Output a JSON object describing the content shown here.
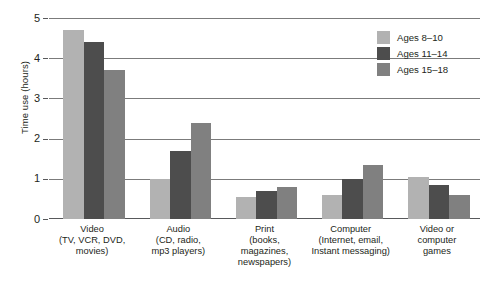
{
  "chart_data": {
    "type": "bar",
    "title": "",
    "xlabel": "",
    "ylabel": "Time use (hours)",
    "ylim": [
      0,
      5
    ],
    "yticks": [
      0,
      1,
      2,
      3,
      4,
      5
    ],
    "ytick_labels": [
      "0",
      "1",
      "2",
      "3",
      "4",
      "5"
    ],
    "grid": true,
    "legend_position": "top-right",
    "categories": [
      "Video\n(TV, VCR, DVD,\nmovies)",
      "Audio\n(CD, radio,\nmp3 players)",
      "Print\n(books,\nmagazines,\nnewspapers)",
      "Computer\n(Internet, email,\nInstant messaging)",
      "Video or\ncomputer\ngames"
    ],
    "category_lines": [
      [
        "Video",
        "(TV, VCR, DVD,",
        "movies)"
      ],
      [
        "Audio",
        "(CD, radio,",
        "mp3 players)"
      ],
      [
        "Print",
        "(books,",
        "magazines,",
        "newspapers)"
      ],
      [
        "Computer",
        "(Internet, email,",
        "Instant messaging)"
      ],
      [
        "Video or",
        "computer",
        "games"
      ]
    ],
    "series": [
      {
        "name": "Ages 8–10",
        "color": "#b2b2b2",
        "values": [
          4.7,
          1.0,
          0.55,
          0.6,
          1.05
        ]
      },
      {
        "name": "Ages 11–14",
        "color": "#4d4d4d",
        "values": [
          4.4,
          1.7,
          0.7,
          1.0,
          0.85
        ]
      },
      {
        "name": "Ages 15–18",
        "color": "#808080",
        "values": [
          3.7,
          2.4,
          0.8,
          1.35,
          0.6
        ]
      }
    ]
  },
  "axis": {
    "y_title": "Time use (hours)",
    "ticks": [
      "5",
      "4",
      "3",
      "2",
      "1",
      "0"
    ]
  },
  "legend": {
    "items": [
      {
        "label": "Ages 8–10",
        "color": "#b2b2b2"
      },
      {
        "label": "Ages 11–14",
        "color": "#4d4d4d"
      },
      {
        "label": "Ages 15–18",
        "color": "#808080"
      }
    ]
  }
}
